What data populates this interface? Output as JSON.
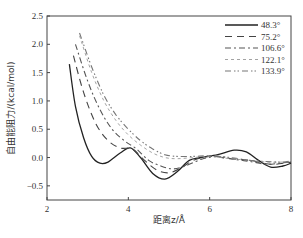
{
  "chart_data": {
    "type": "line",
    "title": "",
    "xlabel": "距离z/Å",
    "ylabel": "自由能阻力/(kcal/mol)",
    "xlim": [
      2,
      8
    ],
    "ylim": [
      -0.75,
      2.5
    ],
    "xticks": [
      2,
      4,
      6,
      8
    ],
    "yticks": [
      -0.5,
      0.0,
      0.5,
      1.0,
      1.5,
      2.0,
      2.5
    ],
    "ytick_labels": [
      "−0.5",
      "0.0",
      "0.5",
      "1.0",
      "1.5",
      "2.0",
      "2.5"
    ],
    "grid": false,
    "legend_position": "upper right",
    "series": [
      {
        "name": "48.3°",
        "style": "solid",
        "color": "#222222",
        "x": [
          2.55,
          2.7,
          2.9,
          3.1,
          3.3,
          3.5,
          3.8,
          4.05,
          4.3,
          4.6,
          4.9,
          5.2,
          5.5,
          5.8,
          6.2,
          6.6,
          6.9,
          7.2,
          7.5,
          7.8,
          8.0
        ],
        "y": [
          1.65,
          0.9,
          0.35,
          0.02,
          -0.1,
          -0.08,
          0.08,
          0.17,
          0.0,
          -0.28,
          -0.38,
          -0.25,
          -0.05,
          0.0,
          0.05,
          0.13,
          0.1,
          -0.05,
          -0.17,
          -0.15,
          -0.1
        ]
      },
      {
        "name": "75.2°",
        "style": "long-dash",
        "color": "#444444",
        "x": [
          2.65,
          2.9,
          3.2,
          3.5,
          3.8,
          4.1,
          4.4,
          4.7,
          5.0,
          5.3,
          5.6,
          6.0,
          6.5,
          7.0,
          7.3,
          7.6,
          8.0
        ],
        "y": [
          1.8,
          1.15,
          0.6,
          0.3,
          0.17,
          0.15,
          -0.05,
          -0.22,
          -0.27,
          -0.18,
          -0.05,
          0.02,
          -0.02,
          -0.05,
          -0.1,
          -0.12,
          -0.08
        ]
      },
      {
        "name": "106.6°",
        "style": "dash-dot",
        "color": "#555555",
        "x": [
          2.7,
          3.0,
          3.3,
          3.6,
          3.9,
          4.2,
          4.5,
          4.8,
          5.1,
          5.4,
          5.8,
          6.2,
          6.6,
          7.0,
          7.4,
          7.7,
          8.0
        ],
        "y": [
          2.0,
          1.35,
          0.85,
          0.5,
          0.3,
          0.15,
          -0.05,
          -0.15,
          -0.2,
          -0.15,
          -0.03,
          0.02,
          -0.03,
          -0.07,
          -0.12,
          -0.1,
          -0.08
        ]
      },
      {
        "name": "122.1°",
        "style": "short-dash",
        "color": "#999999",
        "x": [
          2.8,
          3.1,
          3.4,
          3.7,
          4.0,
          4.3,
          4.6,
          4.9,
          5.2,
          5.6,
          6.0,
          6.5,
          7.0,
          7.4,
          7.8,
          8.0
        ],
        "y": [
          2.15,
          1.5,
          1.0,
          0.65,
          0.4,
          0.22,
          0.08,
          0.0,
          -0.02,
          0.0,
          0.02,
          -0.02,
          -0.05,
          -0.08,
          -0.08,
          -0.07
        ]
      },
      {
        "name": "133.9°",
        "style": "dash-dot-dot",
        "color": "#777777",
        "x": [
          2.8,
          3.1,
          3.4,
          3.7,
          4.0,
          4.3,
          4.6,
          4.9,
          5.2,
          5.6,
          6.0,
          6.5,
          7.0,
          7.4,
          7.8,
          8.0
        ],
        "y": [
          2.2,
          1.6,
          1.1,
          0.75,
          0.5,
          0.3,
          0.15,
          0.05,
          0.02,
          0.02,
          0.03,
          0.0,
          -0.05,
          -0.07,
          -0.08,
          -0.06
        ]
      }
    ]
  }
}
